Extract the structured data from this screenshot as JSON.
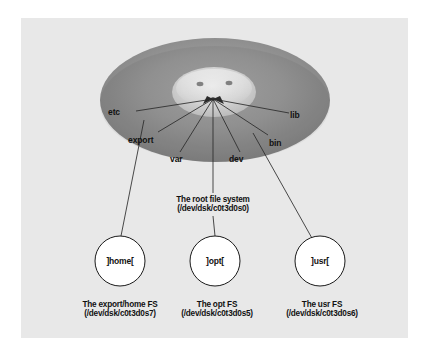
{
  "figure": {
    "type": "disk-partition-diagram",
    "panel_background": "#e8e8e8",
    "disk_color_outer": "#8f8f8f",
    "disk_color_hub": "#d8d8d8",
    "line_color": "#2a2a2a",
    "circle_fill": "#ffffff",
    "circle_stroke": "#1a1a1a"
  },
  "disk": {
    "name": "disk-platter",
    "directories": [
      {
        "id": "etc",
        "label": "etc",
        "x": 117,
        "y": 113
      },
      {
        "id": "lib",
        "label": "lib",
        "x": 292,
        "y": 116
      },
      {
        "id": "export",
        "label": "export",
        "x": 126,
        "y": 141
      },
      {
        "id": "bin",
        "label": "bin",
        "x": 271,
        "y": 143
      },
      {
        "id": "var",
        "label": "var",
        "x": 170,
        "y": 160
      },
      {
        "id": "dev",
        "label": "dev",
        "x": 228,
        "y": 160
      }
    ]
  },
  "root_fs": {
    "name": "root-file-system",
    "title": "The root file system",
    "device": "(/dev/dsk/c0t3d0s0)"
  },
  "filesystems": [
    {
      "id": "home",
      "mount_label": "]home[",
      "title": "The export/home FS",
      "device": "(/dev/dsk/c0t3d0s7)",
      "circle_cx": 120,
      "circle_cy": 261,
      "circle_r": 25
    },
    {
      "id": "opt",
      "mount_label": "]opt[",
      "title": "The opt FS",
      "device": "(/dev/dsk/c0t3d0s5)",
      "circle_cx": 215,
      "circle_cy": 261,
      "circle_r": 25
    },
    {
      "id": "usr",
      "mount_label": "]usr[",
      "title": "The usr FS",
      "device": "(/dev/dsk/c0t3d0s6)",
      "circle_cx": 320,
      "circle_cy": 261,
      "circle_r": 25
    }
  ]
}
